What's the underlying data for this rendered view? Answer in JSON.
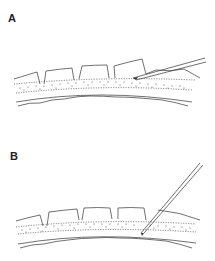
{
  "figure": {
    "panels": [
      {
        "label": "A",
        "description": "Pipette inserted at shallow angle between cell layer and stippled layer"
      },
      {
        "label": "B",
        "description": "Pipette inserted at steep angle through layers to inner membrane"
      }
    ],
    "colors": {
      "line": "#333333",
      "stipple": "#555555",
      "background": "#ffffff"
    }
  }
}
